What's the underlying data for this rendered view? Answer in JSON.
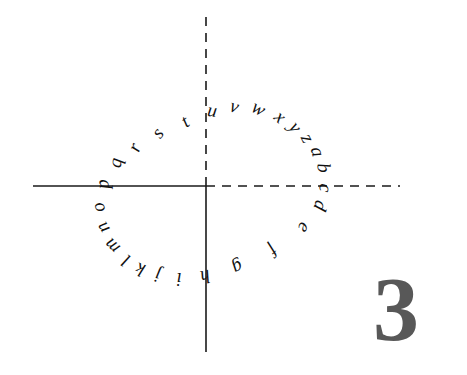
{
  "figure": {
    "number_label": "3",
    "number_color": "#585858",
    "number_font_size": 92,
    "number_x": 373,
    "number_y": 263,
    "background_color": "#ffffff",
    "ink_color": "#111111",
    "axis_color": "#1a1a1a"
  },
  "axes": {
    "origin_x": 206,
    "origin_y": 186,
    "horizontal_left": {
      "name": "negative-x-axis",
      "style": "solid",
      "x_start": 33,
      "x_end": 206,
      "stroke_width": 1.6
    },
    "horizontal_right": {
      "name": "positive-x-axis",
      "style": "dashed",
      "x_start": 206,
      "x_end": 400,
      "stroke_width": 1.6,
      "dash_pattern": "9 7"
    },
    "vertical_up": {
      "name": "positive-y-axis",
      "style": "dashed",
      "y_start": 186,
      "y_end": 17,
      "stroke_width": 1.6,
      "dash_pattern": "9 7"
    },
    "vertical_down": {
      "name": "negative-y-axis",
      "style": "solid",
      "y_start": 186,
      "y_end": 352,
      "stroke_width": 1.6
    }
  },
  "letter_ring": {
    "description": "handwritten lowercase alphabet arranged around a circle",
    "center_x": 185,
    "center_y": 198,
    "radius": 97,
    "letters": [
      {
        "char": "u",
        "angle_deg": 100,
        "rotation_deg": 8,
        "x": 212,
        "y": 112
      },
      {
        "char": "v",
        "angle_deg": 88,
        "rotation_deg": 16,
        "x": 234,
        "y": 108
      },
      {
        "char": "w",
        "angle_deg": 76,
        "rotation_deg": 28,
        "x": 258,
        "y": 110
      },
      {
        "char": "x",
        "angle_deg": 64,
        "rotation_deg": 42,
        "x": 279,
        "y": 118
      },
      {
        "char": "y",
        "angle_deg": 53,
        "rotation_deg": 54,
        "x": 294,
        "y": 128
      },
      {
        "char": "z",
        "angle_deg": 43,
        "rotation_deg": 64,
        "x": 306,
        "y": 139
      },
      {
        "char": "a",
        "angle_deg": 33,
        "rotation_deg": 74,
        "x": 316,
        "y": 152
      },
      {
        "char": "b",
        "angle_deg": 23,
        "rotation_deg": 84,
        "x": 322,
        "y": 168
      },
      {
        "char": "c",
        "angle_deg": 11,
        "rotation_deg": 96,
        "x": 324,
        "y": 188
      },
      {
        "char": "d",
        "angle_deg": -2,
        "rotation_deg": 108,
        "x": 319,
        "y": 205
      },
      {
        "char": "e",
        "angle_deg": -16,
        "rotation_deg": 122,
        "x": 303,
        "y": 227
      },
      {
        "char": "f",
        "angle_deg": -32,
        "rotation_deg": 138,
        "x": 272,
        "y": 249
      },
      {
        "char": "g",
        "angle_deg": -48,
        "rotation_deg": 152,
        "x": 237,
        "y": 266
      },
      {
        "char": "h",
        "angle_deg": -62,
        "rotation_deg": 166,
        "x": 205,
        "y": 275
      },
      {
        "char": "i",
        "angle_deg": -76,
        "rotation_deg": 180,
        "x": 179,
        "y": 277
      },
      {
        "char": "j",
        "angle_deg": -88,
        "rotation_deg": 192,
        "x": 158,
        "y": 274
      },
      {
        "char": "k",
        "angle_deg": -99,
        "rotation_deg": 202,
        "x": 141,
        "y": 268
      },
      {
        "char": "l",
        "angle_deg": -110,
        "rotation_deg": 212,
        "x": 127,
        "y": 259
      },
      {
        "char": "m",
        "angle_deg": -122,
        "rotation_deg": 224,
        "x": 113,
        "y": 245
      },
      {
        "char": "n",
        "angle_deg": -136,
        "rotation_deg": 238,
        "x": 104,
        "y": 227
      },
      {
        "char": "o",
        "angle_deg": -150,
        "rotation_deg": 252,
        "x": 100,
        "y": 207
      },
      {
        "char": "p",
        "angle_deg": -166,
        "rotation_deg": 266,
        "x": 104,
        "y": 184
      },
      {
        "char": "q",
        "angle_deg": 178,
        "rotation_deg": 280,
        "x": 117,
        "y": 163
      },
      {
        "char": "r",
        "angle_deg": 164,
        "rotation_deg": 292,
        "x": 136,
        "y": 148
      },
      {
        "char": "s",
        "angle_deg": 147,
        "rotation_deg": 307,
        "x": 159,
        "y": 134
      },
      {
        "char": "t",
        "angle_deg": 126,
        "rotation_deg": 326,
        "x": 186,
        "y": 123
      }
    ]
  }
}
